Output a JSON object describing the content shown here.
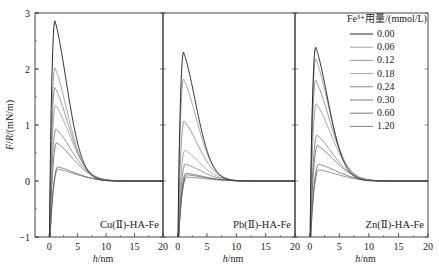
{
  "chart_data": {
    "type": "line",
    "layout": "three side-by-side panels sharing y-axis",
    "ylabel": "F/R/(mN/m)",
    "xlabel": "h/nm",
    "ylim": [
      -1,
      3
    ],
    "yticks": [
      -1,
      0,
      1,
      2,
      3
    ],
    "xlim": [
      -2.5,
      20
    ],
    "xticks": [
      0,
      5,
      10,
      15,
      20
    ],
    "grid": false,
    "legend": {
      "title": "Fe³⁺用量/(mmol/L)",
      "position": "upper right (in third panel)",
      "entries": [
        "0.00",
        "0.06",
        "0.12",
        "0.18",
        "0.24",
        "0.30",
        "0.60",
        "1.20"
      ]
    },
    "panels": [
      {
        "label": "Cu(Ⅱ)-HA-Fe",
        "series": [
          {
            "name": "0.00",
            "peak_h": 1.0,
            "peak_F": 2.86
          },
          {
            "name": "0.06",
            "peak_h": 1.0,
            "peak_F": 2.02
          },
          {
            "name": "0.12",
            "peak_h": 1.0,
            "peak_F": 1.67
          },
          {
            "name": "0.18",
            "peak_h": 1.1,
            "peak_F": 1.35
          },
          {
            "name": "0.24",
            "peak_h": 1.2,
            "peak_F": 0.93
          },
          {
            "name": "0.30",
            "peak_h": 1.3,
            "peak_F": 0.68
          },
          {
            "name": "0.60",
            "peak_h": 1.5,
            "peak_F": 0.25
          },
          {
            "name": "1.20",
            "peak_h": 1.5,
            "peak_F": 0.21
          }
        ]
      },
      {
        "label": "Pb(Ⅱ)-HA-Fe",
        "series": [
          {
            "name": "0.00",
            "peak_h": 1.0,
            "peak_F": 2.3
          },
          {
            "name": "0.06",
            "peak_h": 1.0,
            "peak_F": 1.82
          },
          {
            "name": "0.12",
            "peak_h": 1.1,
            "peak_F": 1.07
          },
          {
            "name": "0.18",
            "peak_h": 1.2,
            "peak_F": 0.55
          },
          {
            "name": "0.24",
            "peak_h": 1.3,
            "peak_F": 0.3
          },
          {
            "name": "0.30",
            "peak_h": 1.4,
            "peak_F": 0.14
          },
          {
            "name": "0.60",
            "peak_h": 1.5,
            "peak_F": 0.11
          },
          {
            "name": "1.20",
            "peak_h": 1.5,
            "peak_F": 0.07
          }
        ]
      },
      {
        "label": "Zn(Ⅱ)-HA-Fe",
        "series": [
          {
            "name": "0.00",
            "peak_h": 1.0,
            "peak_F": 2.39
          },
          {
            "name": "0.06",
            "peak_h": 1.0,
            "peak_F": 2.18
          },
          {
            "name": "0.12",
            "peak_h": 1.0,
            "peak_F": 1.8
          },
          {
            "name": "0.18",
            "peak_h": 1.1,
            "peak_F": 1.38
          },
          {
            "name": "0.24",
            "peak_h": 1.2,
            "peak_F": 0.82
          },
          {
            "name": "0.30",
            "peak_h": 1.3,
            "peak_F": 0.63
          },
          {
            "name": "0.60",
            "peak_h": 1.5,
            "peak_F": 0.3
          },
          {
            "name": "1.20",
            "peak_h": 1.5,
            "peak_F": 0.2
          }
        ]
      }
    ],
    "series_colors": [
      "#2a2a2a",
      "#8a8a8a",
      "#7a7a7a",
      "#8c8c8c",
      "#6e6e6e",
      "#5a5a5a",
      "#555555",
      "#666666"
    ]
  }
}
